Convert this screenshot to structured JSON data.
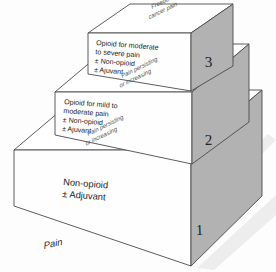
{
  "diagram": {
    "background_color": "#fdfdfd",
    "side_face_color": "#b2b2b2",
    "top_face_color": "#ffffff",
    "outline_color": "#4a4a4a"
  },
  "baseline_label": "Pain",
  "goal_label_line1": "Freedom from",
  "goal_label_line2": "cancer pain",
  "steps": [
    {
      "number": "1",
      "front_lines": [
        "Non-opioid",
        "± Adjuvant"
      ],
      "top_label_line1": "",
      "top_label_line2": ""
    },
    {
      "number": "2",
      "front_lines": [
        "Opioid for mild to",
        "moderate pain",
        "± Non-opioid",
        "± Ajuvant"
      ],
      "top_label_line1": "Pain persisting",
      "top_label_line2": "or increasing"
    },
    {
      "number": "3",
      "front_lines": [
        "Opioid for moderate",
        "to severe pain",
        "± Non-opioid",
        "± Ajuvant"
      ],
      "top_label_line1": "Pain persisting",
      "top_label_line2": "or increasing"
    }
  ],
  "transition_labels": {
    "step1_to_step2_line1": "Pain persisting",
    "step1_to_step2_line2": "or increasing",
    "step2_to_step3_line1": "Pain persisting",
    "step2_to_step3_line2": "or increasing"
  },
  "step1_front": {
    "line1": "Non-opioid",
    "line2": "± Adjuvant"
  },
  "step2_front": {
    "line1": "Opioid for mild to",
    "line2": "moderate pain",
    "line3": "± Non-opioid",
    "line4": "± Ajuvant"
  },
  "step3_front": {
    "line1": "Opioid for moderate",
    "line2": "to severe pain",
    "line3": "± Non-opioid",
    "line4": "± Ajuvant"
  },
  "step_numbers": {
    "one": "1",
    "two": "2",
    "three": "3"
  }
}
